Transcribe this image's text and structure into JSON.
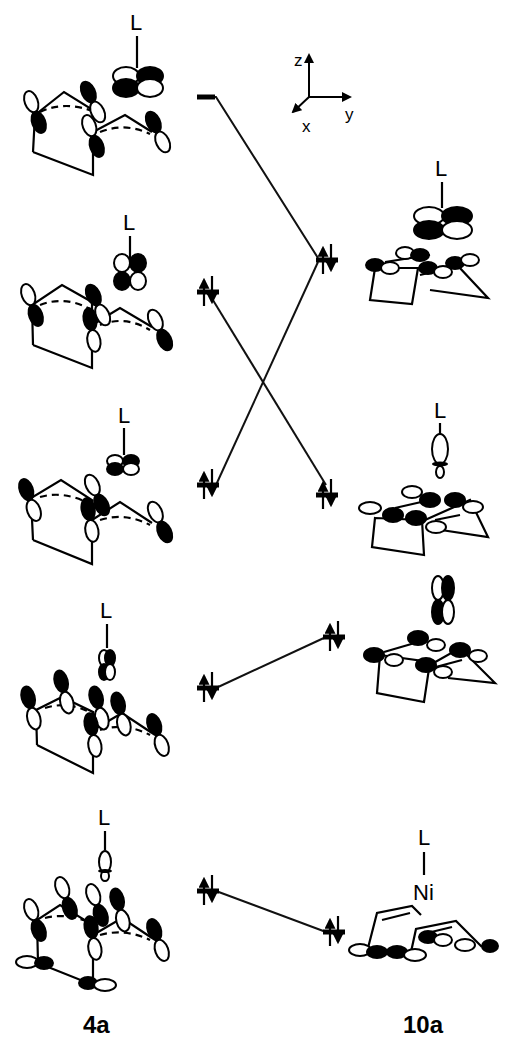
{
  "figure": {
    "type": "molecular orbital correlation diagram",
    "axes": {
      "z": "z",
      "y": "y",
      "x": "x"
    },
    "left_compound": {
      "label": "4a",
      "ligand_label": "L"
    },
    "right_compound": {
      "label": "10a",
      "ligand_label": "L",
      "metal_label": "Ni"
    },
    "left_levels": [
      {
        "index": 1,
        "y": 155,
        "occupancy": "empty"
      },
      {
        "index": 2,
        "y": 290,
        "occupancy": "up-down pair"
      },
      {
        "index": 3,
        "y": 485,
        "occupancy": "up-down pair"
      },
      {
        "index": 4,
        "y": 685,
        "occupancy": "up-down pair"
      },
      {
        "index": 5,
        "y": 885,
        "occupancy": "up-down pair"
      }
    ],
    "right_levels": [
      {
        "index": 1,
        "y": 260,
        "occupancy": "up-down pair"
      },
      {
        "index": 2,
        "y": 485,
        "occupancy": "up-down pair"
      },
      {
        "index": 3,
        "y": 635,
        "occupancy": "up-down pair"
      },
      {
        "index": 4,
        "y": 915,
        "occupancy": "up-down pair"
      }
    ],
    "correlations": [
      {
        "from": "left-1",
        "to": "right-1"
      },
      {
        "from": "left-2",
        "to": "right-2"
      },
      {
        "from": "left-3",
        "to": "right-1"
      },
      {
        "from": "left-4",
        "to": "right-3"
      },
      {
        "from": "left-5",
        "to": "right-4"
      }
    ]
  },
  "labels": {
    "L": "L",
    "Ni": "Ni",
    "left": "4a",
    "right": "10a",
    "axis_z": "z",
    "axis_y": "y",
    "axis_x": "x"
  }
}
